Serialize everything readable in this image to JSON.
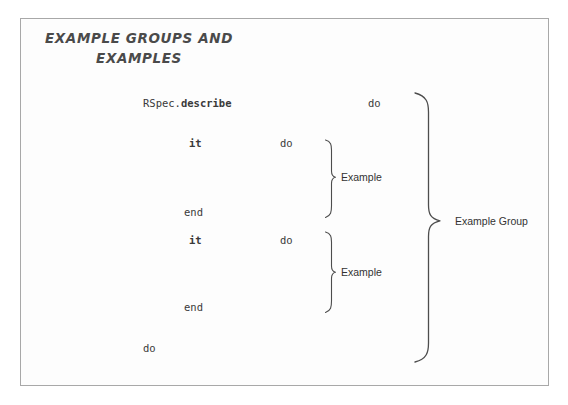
{
  "slide": {
    "title": "EXAMPLE GROUPS AND\nEXAMPLES",
    "background_color": "#fdfdfd",
    "border_color": "#a8a8a8",
    "text_color": "#3a3a3a"
  },
  "code": {
    "lines": [
      {
        "id": "describe-call",
        "prefix": "RSpec.",
        "keyword": "describe",
        "trailer": "do"
      },
      {
        "id": "it-block-1",
        "keyword": "it",
        "trailer": "do"
      },
      {
        "id": "end-1",
        "keyword": "end"
      },
      {
        "id": "it-block-2",
        "keyword": "it",
        "trailer": "do"
      },
      {
        "id": "end-2",
        "keyword": "end"
      },
      {
        "id": "final",
        "keyword": "do"
      }
    ],
    "rspec_prefix": "RSpec.",
    "describe_keyword": "describe",
    "do_keyword_1": "do",
    "it_keyword_1": "it",
    "do_keyword_2": "do",
    "end_keyword_1": "end",
    "it_keyword_2": "it",
    "do_keyword_3": "do",
    "end_keyword_2": "end",
    "do_keyword_4": "do"
  },
  "annotations": {
    "example_1": "Example",
    "example_2": "Example",
    "example_group": "Example Group"
  }
}
